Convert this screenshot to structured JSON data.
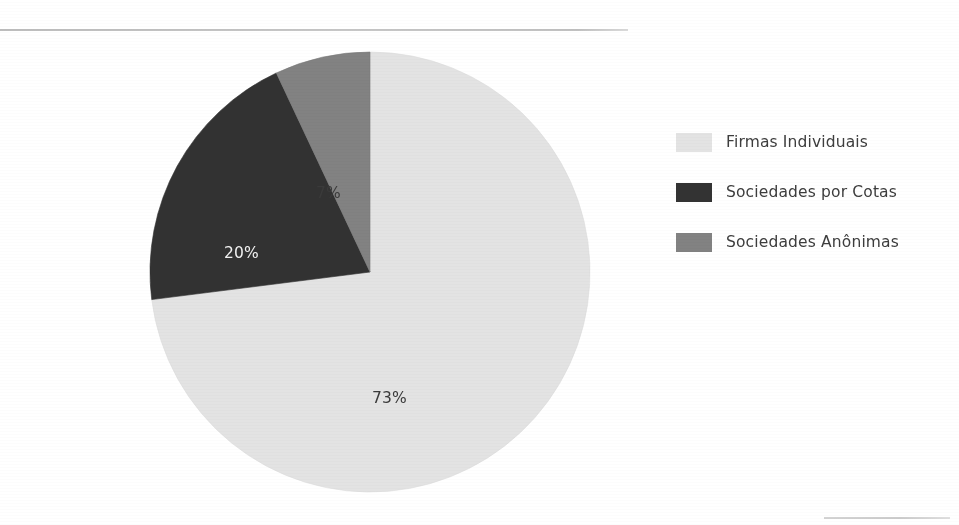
{
  "figure": {
    "background_color": "#ffffff",
    "rules": {
      "top_rule_color": "#c0c0c0",
      "bottom_rule_color": "#cccccc"
    }
  },
  "chart_data": {
    "type": "pie",
    "title": "",
    "subtitle": "",
    "xlabel": "",
    "ylabel": "",
    "grid": false,
    "legend_position": "right",
    "start_angle_deg": 0,
    "direction": "clockwise",
    "categories": [
      "Firmas Individuais",
      "Sociedades por Cotas",
      "Sociedades Anônimas"
    ],
    "values": [
      73,
      20,
      7
    ],
    "value_suffix": "%",
    "data_labels": [
      "73%",
      "20%",
      "7%"
    ],
    "colors": [
      "#e3e3e3",
      "#333333",
      "#828282"
    ],
    "label_text_colors": [
      "#3a3a3a",
      "#f2f2f2",
      "#3a3a3a"
    ],
    "slices": [
      {
        "name": "Firmas Individuais",
        "value": 73,
        "label": "73%",
        "color": "#e3e3e3",
        "label_color": "#3a3a3a",
        "start_deg": 0,
        "end_deg": 262.8
      },
      {
        "name": "Sociedades por Cotas",
        "value": 20,
        "label": "20%",
        "color": "#333333",
        "label_color": "#f2f2f2",
        "start_deg": 262.8,
        "end_deg": 334.8
      },
      {
        "name": "Sociedades Anônimas",
        "value": 7,
        "label": "7%",
        "color": "#828282",
        "label_color": "#3a3a3a",
        "start_deg": 334.8,
        "end_deg": 360
      }
    ]
  },
  "legend": {
    "items": [
      {
        "label": "Firmas Individuais",
        "color": "#e3e3e3"
      },
      {
        "label": "Sociedades por Cotas",
        "color": "#333333"
      },
      {
        "label": "Sociedades Anônimas",
        "color": "#828282"
      }
    ]
  },
  "labels": {
    "major": "73%",
    "mid": "20%",
    "minor": "7%"
  }
}
